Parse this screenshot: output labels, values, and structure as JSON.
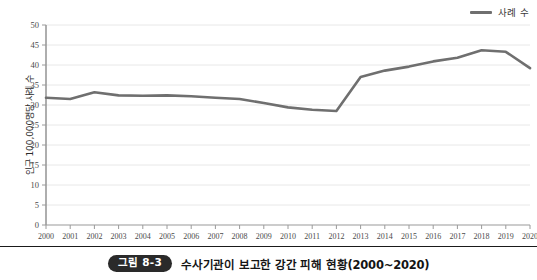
{
  "chart_data": {
    "type": "line",
    "title": "",
    "xlabel": "",
    "ylabel": "인구 100,000명당 사례 수",
    "categories": [
      "2000",
      "2001",
      "2002",
      "2003",
      "2004",
      "2005",
      "2006",
      "2007",
      "2008",
      "2009",
      "2010",
      "2011",
      "2012",
      "2013",
      "2014",
      "2015",
      "2016",
      "2017",
      "2018",
      "2019",
      "2020"
    ],
    "series": [
      {
        "name": "사례 수",
        "color": "#6f6f6f",
        "values": [
          31.8,
          31.5,
          33.2,
          32.4,
          32.3,
          32.4,
          32.2,
          31.8,
          31.5,
          30.5,
          29.4,
          28.8,
          28.5,
          37.0,
          38.6,
          39.6,
          40.9,
          41.8,
          43.7,
          43.3,
          39.2
        ]
      }
    ],
    "ylim": [
      0,
      50
    ],
    "y_ticks": [
      0,
      5,
      10,
      15,
      20,
      25,
      30,
      35,
      40,
      45,
      50
    ],
    "grid": true,
    "grid_axis": "y",
    "legend_position": "top-right"
  },
  "legend": {
    "items": [
      {
        "label": "사례 수",
        "color": "#6f6f6f"
      }
    ]
  },
  "axes": {
    "y_title": "인구 100,000명당 사례 수"
  },
  "caption": {
    "badge": "그림 8-3",
    "text": "수사기관이 보고한 강간 피해 현황(2000~2020)"
  },
  "colors": {
    "line": "#6f6f6f",
    "axis": "#8a8a8a",
    "grid": "#e8e8e8",
    "text": "#2b2b2b",
    "badge_bg": "#2a2a2a"
  }
}
